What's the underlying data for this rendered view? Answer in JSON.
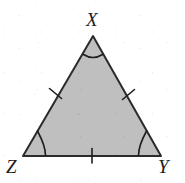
{
  "figure": {
    "kind": "geometry-diagram",
    "shape": "triangle",
    "name": "Triangle XYZ",
    "canvas": {
      "width": 185,
      "height": 183,
      "background": "#ffffff"
    },
    "style": {
      "fill": "#bfbfbf",
      "stroke": "#2b2b2b",
      "stroke_width": 2,
      "mark_stroke": "#1d1d1d",
      "mark_stroke_width": 1.6,
      "label_color": "#1d1d1d"
    },
    "vertices": [
      {
        "id": "X",
        "label": "X",
        "x": 93,
        "y": 36,
        "label_x": 86,
        "label_y": 10,
        "angle_mark": "single-arc"
      },
      {
        "id": "Y",
        "label": "Y",
        "x": 161,
        "y": 156,
        "label_x": 158,
        "label_y": 157,
        "angle_mark": "single-arc"
      },
      {
        "id": "Z",
        "label": "Z",
        "x": 23,
        "y": 156,
        "label_x": 6,
        "label_y": 157,
        "angle_mark": "single-arc"
      }
    ],
    "sides": [
      {
        "id": "XZ",
        "from": "X",
        "to": "Z",
        "tick_marks": 1,
        "tick_x": 55,
        "tick_y": 93
      },
      {
        "id": "XY",
        "from": "X",
        "to": "Y",
        "tick_marks": 1,
        "tick_x": 128,
        "tick_y": 94
      },
      {
        "id": "ZY",
        "from": "Z",
        "to": "Y",
        "tick_marks": 1,
        "tick_x": 92,
        "tick_y": 156
      }
    ],
    "annotations": {
      "congruent_sides_note": "All three sides bear a single tick mark",
      "congruent_angles_note": "All three interior angles bear a single arc"
    }
  }
}
